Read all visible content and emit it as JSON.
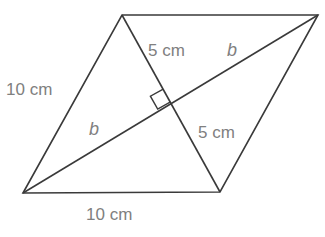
{
  "figure": {
    "type": "parallelogram-with-diagonal-and-altitude",
    "background_color": "#ffffff",
    "stroke_color": "#3a3a3a",
    "label_color": "#808080",
    "width": 325,
    "height": 237
  },
  "labels": {
    "side_left": "10 cm",
    "side_bottom": "10 cm",
    "height_top": "5 cm",
    "height_bottom": "5 cm",
    "diagonal_upper": "b",
    "diagonal_lower": "b"
  },
  "geometry": {
    "vertices": {
      "bottom_left": {
        "x": 23,
        "y": 193
      },
      "top_left": {
        "x": 122,
        "y": 15
      },
      "top_right": {
        "x": 318,
        "y": 15
      },
      "bottom_right": {
        "x": 220,
        "y": 192
      }
    },
    "intersection": {
      "x": 172,
      "y": 105
    },
    "right_angle_marker": {
      "size": 15
    },
    "edges": [
      {
        "name": "left-side",
        "from": "bottom_left",
        "to": "top_left",
        "label": "10 cm"
      },
      {
        "name": "top-side",
        "from": "top_left",
        "to": "top_right",
        "label": ""
      },
      {
        "name": "right-side",
        "from": "top_right",
        "to": "bottom_right",
        "label": ""
      },
      {
        "name": "bottom-side",
        "from": "bottom_right",
        "to": "bottom_left",
        "label": "10 cm"
      }
    ],
    "interior_lines": [
      {
        "name": "diagonal",
        "from": "bottom_left",
        "to": "top_right",
        "label": "b"
      },
      {
        "name": "altitude",
        "from": "top_left",
        "to": "bottom_right",
        "label": "5 cm"
      }
    ]
  }
}
